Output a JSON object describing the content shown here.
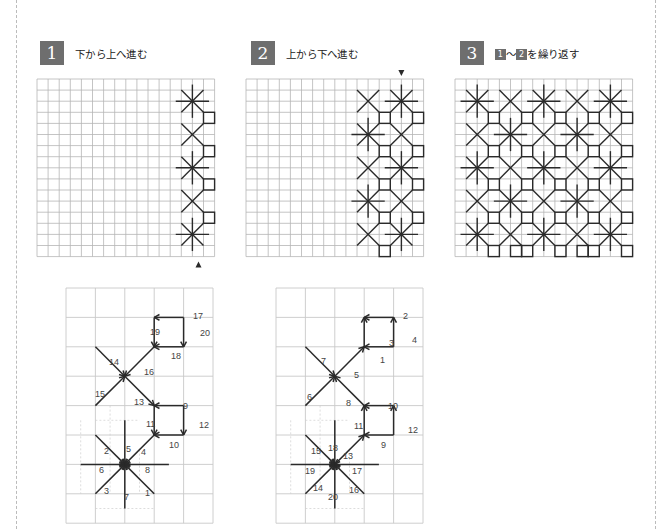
{
  "steps": [
    {
      "number": "1",
      "title": "下から上へ進む",
      "x": 40
    },
    {
      "number": "2",
      "title": "上から下へ進む",
      "x": 251
    },
    {
      "number": "3",
      "title_prefix": "1",
      "title_sep": "～",
      "title_prefix2": "2",
      "title_suffix": "を繰り返す",
      "x": 460
    }
  ],
  "colors": {
    "grid": "#b5b5b5",
    "stitch": "#2a2a2a",
    "step_badge": "#6e6e6e",
    "border": "#bbbbbb"
  },
  "top_grids": [
    {
      "id": "grid-1",
      "x": 37,
      "y": 79,
      "cols": 16,
      "rows": 16,
      "cell": 11.1,
      "motifs": [
        {
          "type": "star",
          "c": 14,
          "r": 2
        },
        {
          "type": "x",
          "c": 14,
          "r": 5
        },
        {
          "type": "star",
          "c": 14,
          "r": 8
        },
        {
          "type": "x",
          "c": 14,
          "r": 11
        },
        {
          "type": "star",
          "c": 14,
          "r": 14
        }
      ],
      "squares": [
        [
          15,
          3
        ],
        [
          15,
          6
        ],
        [
          15,
          9
        ],
        [
          15,
          12
        ]
      ],
      "arrow": {
        "dir": "up",
        "c": 15,
        "below": true
      }
    },
    {
      "id": "grid-2",
      "x": 246,
      "y": 79,
      "cols": 16,
      "rows": 16,
      "cell": 11.1,
      "motifs": [
        {
          "type": "x",
          "c": 11,
          "r": 2
        },
        {
          "type": "star",
          "c": 11,
          "r": 5
        },
        {
          "type": "x",
          "c": 11,
          "r": 8
        },
        {
          "type": "star",
          "c": 11,
          "r": 11
        },
        {
          "type": "x",
          "c": 11,
          "r": 14
        },
        {
          "type": "star",
          "c": 14,
          "r": 2
        },
        {
          "type": "x",
          "c": 14,
          "r": 5
        },
        {
          "type": "star",
          "c": 14,
          "r": 8
        },
        {
          "type": "x",
          "c": 14,
          "r": 11
        },
        {
          "type": "star",
          "c": 14,
          "r": 14
        }
      ],
      "squares": [
        [
          12,
          3
        ],
        [
          12,
          6
        ],
        [
          12,
          9
        ],
        [
          12,
          12
        ],
        [
          12,
          15
        ],
        [
          15,
          3
        ],
        [
          15,
          6
        ],
        [
          15,
          9
        ],
        [
          15,
          12
        ]
      ],
      "arrow": {
        "dir": "down",
        "c": 14,
        "below": false
      }
    },
    {
      "id": "grid-3",
      "x": 455,
      "y": 79,
      "cols": 16,
      "rows": 16,
      "cell": 11.1,
      "motifs": "checker",
      "centers_c": [
        2,
        5,
        8,
        11,
        14
      ],
      "centers_r": [
        2,
        5,
        8,
        11,
        14
      ]
    }
  ],
  "lower_diagrams": [
    {
      "id": "diagram-1",
      "x": 66,
      "y": 288,
      "cols": 5,
      "rows": 8,
      "cell": 29.4,
      "labels": [
        {
          "t": "17",
          "x": 127,
          "y": 31
        },
        {
          "t": "20",
          "x": 134,
          "y": 48
        },
        {
          "t": "19",
          "x": 84,
          "y": 47
        },
        {
          "t": "18",
          "x": 105,
          "y": 71
        },
        {
          "t": "14",
          "x": 43,
          "y": 77
        },
        {
          "t": "16",
          "x": 78,
          "y": 87
        },
        {
          "t": "15",
          "x": 29,
          "y": 109
        },
        {
          "t": "13",
          "x": 68,
          "y": 117
        },
        {
          "t": "9",
          "x": 117,
          "y": 121
        },
        {
          "t": "12",
          "x": 133,
          "y": 140
        },
        {
          "t": "11",
          "x": 80,
          "y": 139
        },
        {
          "t": "10",
          "x": 103,
          "y": 160
        },
        {
          "t": "2",
          "x": 38,
          "y": 166
        },
        {
          "t": "5",
          "x": 60,
          "y": 164
        },
        {
          "t": "4",
          "x": 75,
          "y": 167
        },
        {
          "t": "6",
          "x": 33,
          "y": 185
        },
        {
          "t": "8",
          "x": 79,
          "y": 185
        },
        {
          "t": "3",
          "x": 38,
          "y": 206
        },
        {
          "t": "7",
          "x": 58,
          "y": 212
        },
        {
          "t": "1",
          "x": 79,
          "y": 208
        }
      ],
      "square_order": "clockwise-top-first"
    },
    {
      "id": "diagram-2",
      "x": 276,
      "y": 288,
      "cols": 5,
      "rows": 8,
      "cell": 29.4,
      "labels": [
        {
          "t": "2",
          "x": 127,
          "y": 31
        },
        {
          "t": "3",
          "x": 113,
          "y": 58
        },
        {
          "t": "4",
          "x": 136,
          "y": 55
        },
        {
          "t": "1",
          "x": 104,
          "y": 75
        },
        {
          "t": "7",
          "x": 45,
          "y": 76
        },
        {
          "t": "5",
          "x": 78,
          "y": 90
        },
        {
          "t": "6",
          "x": 31,
          "y": 112
        },
        {
          "t": "8",
          "x": 70,
          "y": 118
        },
        {
          "t": "10",
          "x": 112,
          "y": 121
        },
        {
          "t": "11",
          "x": 78,
          "y": 141
        },
        {
          "t": "12",
          "x": 132,
          "y": 145
        },
        {
          "t": "9",
          "x": 105,
          "y": 160
        },
        {
          "t": "15",
          "x": 35,
          "y": 166
        },
        {
          "t": "18",
          "x": 52,
          "y": 163
        },
        {
          "t": "13",
          "x": 67,
          "y": 171
        },
        {
          "t": "19",
          "x": 29,
          "y": 186
        },
        {
          "t": "17",
          "x": 76,
          "y": 186
        },
        {
          "t": "14",
          "x": 37,
          "y": 203
        },
        {
          "t": "20",
          "x": 52,
          "y": 212
        },
        {
          "t": "16",
          "x": 73,
          "y": 205
        }
      ]
    }
  ]
}
